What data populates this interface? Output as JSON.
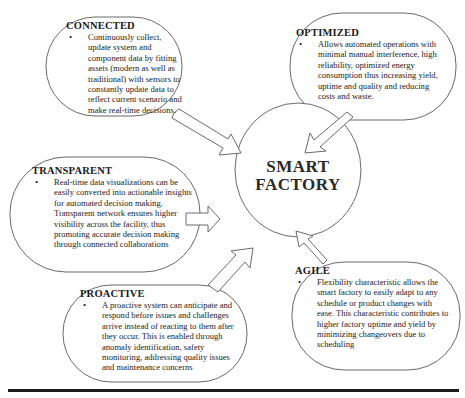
{
  "center": {
    "line1": "SMART",
    "line2": "FACTORY"
  },
  "nodes": [
    {
      "id": "connected",
      "title": "CONNECTED",
      "text": "Continuously collect, update system and component data by fitting assets (modern as well as traditional) with sensors to constantly update data to reflect current scenario and make real-time decisions."
    },
    {
      "id": "optimized",
      "title": "OPTIMIZED",
      "text": "Allows automated operations with minimal manual interference, high reliability, optimized energy consumption thus increasing yield, uptime and quality and reducing costs and waste."
    },
    {
      "id": "transparent",
      "title": "TRANSPARENT",
      "text": "Real-time data visualizations can be easily converted into actionable insights for automated decision making. Transparent network ensures higher visibility across the facility, thus promoting accurate decision making through connected collaborations"
    },
    {
      "id": "proactive",
      "title": "PROACTIVE",
      "text": "A proactive system can anticipate and respond before issues and challenges arrive instead of reacting to them after they occur. This is enabled through anomaly identification, safety monitoring, addressing quality issues and maintenance concerns"
    },
    {
      "id": "agile",
      "title": "AGILE",
      "text": "Flexibility characteristic allows the smart factory to easily adapt to any schedule or product changes with ease. This characteristic contributes to higher factory uptime and yield by minimizing changeovers due to scheduling"
    }
  ],
  "colors": {
    "stroke": "#6a6a6a",
    "text": "#222222",
    "rule": "#1c1c1c"
  }
}
